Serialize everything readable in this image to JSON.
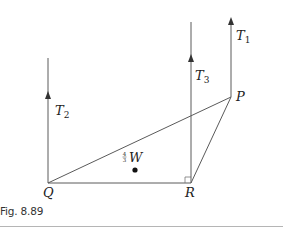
{
  "figure": {
    "caption": "Fig. 8.89",
    "colors": {
      "line": "#5a5a5a",
      "text": "#222222",
      "divider": "#b5b5b5"
    },
    "points": {
      "P": "P",
      "Q": "Q",
      "R": "R"
    },
    "forces": {
      "T1": {
        "symbol": "T",
        "subscript": "1"
      },
      "T2": {
        "symbol": "T",
        "subscript": "2"
      },
      "T3": {
        "symbol": "T",
        "subscript": "3"
      }
    },
    "weight": {
      "fraction_num": "4",
      "fraction_den": "3",
      "symbol": "W"
    }
  }
}
